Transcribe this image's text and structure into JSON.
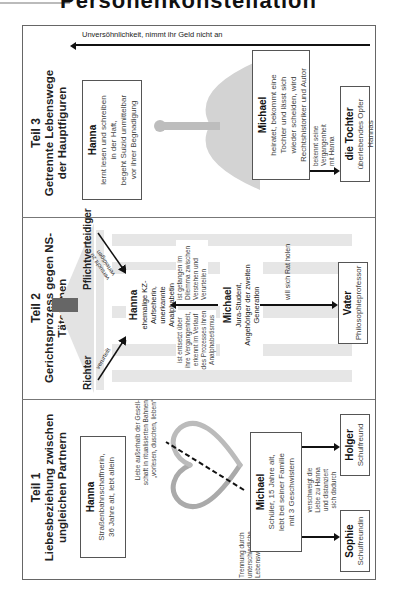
{
  "page": {
    "top_heading_fragment": "Personenkonstellation"
  },
  "diagram": {
    "teil1": {
      "number": "Teil 1",
      "title_line1": "Liebesbeziehung zwischen",
      "title_line2": "ungleichen Partnern",
      "hanna": {
        "name": "Hanna",
        "desc_line1": "Straßenbahnschaffnerin,",
        "desc_line2": "36 Jahre alt, lebt allein"
      },
      "love_note_line1": "Liebe außerhalb der Gesell-",
      "love_note_line2": "schaft in ritualisierten Bahnen",
      "love_note_line3": "„vorlesen, duschen, lieben“",
      "separation_line1": "Trennung durch",
      "separation_line2": "unterschiedliche",
      "separation_line3": "Lebenswelten",
      "michael": {
        "name": "Michael",
        "desc_line1": "Schüler, 15 Jahre alt,",
        "desc_line2": "lebt bei seiner Familie",
        "desc_line3": "mit 3 Geschwistern"
      },
      "conceal_line1": "verschweigt die",
      "conceal_line2": "Liebe zu Hanna",
      "conceal_line3": "und distanziert",
      "conceal_line4": "sich dadurch",
      "sophie": {
        "name": "Sophie",
        "desc": "Schulfreundin"
      },
      "holger": {
        "name": "Holger",
        "desc": "Schulfreund"
      }
    },
    "teil2": {
      "number": "Teil 2",
      "title": "Gerichtsprozess gegen NS-Täterinnen",
      "richter": "Richter",
      "pflichtverteidiger": "Pflichtverteidiger",
      "verurteilt": "verurteilt",
      "versucht_line1": "versucht zu",
      "versucht_line2": "verteidigen",
      "hanna": {
        "name": "Hanna",
        "desc_line1": "ehemalige KZ-Aufseherin,",
        "desc_line2": "unerkannte Analphabetin"
      },
      "entsetzt_line1": "ist entsetzt über",
      "entsetzt_line2": "ihre Vergangenheit,",
      "entsetzt_line3": "erkennt im Verlauf",
      "entsetzt_line4": "des Prozesses ihren",
      "entsetzt_line5": "Analphabetismus",
      "dilemma_line1": "ist gefangen im",
      "dilemma_line2": "Dilemma zwischen",
      "dilemma_line3": "Verstehen und",
      "dilemma_line4": "Verurteilen",
      "michael": {
        "name": "Michael",
        "desc_line1": "Jura-Student,",
        "desc_line2": "Angehöriger der zweiten Generation"
      },
      "rat_label": "will sich Rat holen",
      "vater": {
        "name": "Vater",
        "desc": "Philosophieprofessor"
      }
    },
    "teil3": {
      "number": "Teil 3",
      "title_line1": "Getrennte Lebenswege",
      "title_line2": "der Hauptfiguren",
      "hanna": {
        "name": "Hanna",
        "desc_line1": "lernt lesen und schreiben",
        "desc_line2": "in der Haft,",
        "desc_line3": "begeht Suizid unmittelbar",
        "desc_line4": "vor ihrer Begnadigung"
      },
      "michael": {
        "name": "Michael",
        "desc_line1": "heiratet, bekommt eine",
        "desc_line2": "Tochter und lässt sich",
        "desc_line3": "wieder scheiden, wird",
        "desc_line4": "Rechtshistoriker und Autor"
      },
      "bekennt_line1": "bekennt seine",
      "bekennt_line2": "Vergangenheit",
      "bekennt_line3": "mit Hanna",
      "tochter": {
        "name": "die Tochter",
        "desc": "überlebendes Opfer Hannas"
      },
      "bottom_arrow_label": "Unversöhnlichkeit, nimmt ihr Geld nicht an"
    }
  }
}
